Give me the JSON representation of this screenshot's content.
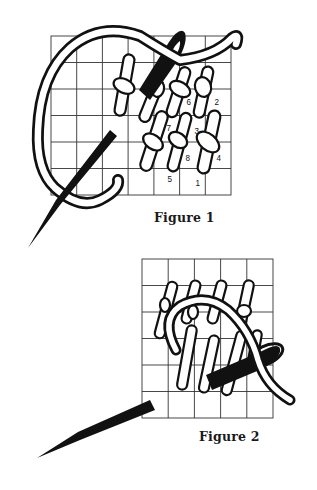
{
  "figures": [
    {
      "id": "figure-1",
      "caption": "Figure 1",
      "grid": {
        "cols": 7,
        "rows": 6,
        "x": 51,
        "y": 36,
        "width": 180,
        "height": 159
      },
      "stitch_numbers": [
        {
          "label": "6",
          "x": 186,
          "y": 97
        },
        {
          "label": "2",
          "x": 214,
          "y": 97
        },
        {
          "label": "7",
          "x": 166,
          "y": 123
        },
        {
          "label": "3",
          "x": 194,
          "y": 126
        },
        {
          "label": "8",
          "x": 185,
          "y": 153
        },
        {
          "label": "4",
          "x": 216,
          "y": 153
        },
        {
          "label": "5",
          "x": 167,
          "y": 174
        },
        {
          "label": "1",
          "x": 195,
          "y": 178
        }
      ]
    },
    {
      "id": "figure-2",
      "caption": "Figure 2",
      "grid": {
        "cols": 5,
        "rows": 6,
        "x": 142,
        "y": 259,
        "width": 131,
        "height": 159
      }
    }
  ],
  "colors": {
    "background": "#ffffff",
    "ink": "#111111",
    "grid_line": "#333333",
    "thread_fill": "#ffffff"
  }
}
